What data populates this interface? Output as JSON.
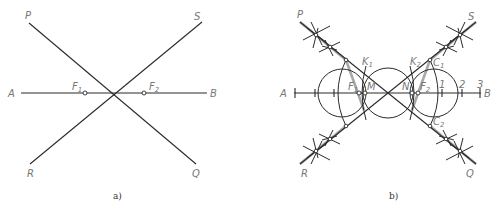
{
  "figure_a": {
    "caption": "a)",
    "labels": {
      "P": "P",
      "S": "S",
      "A": "A",
      "B": "B",
      "R": "R",
      "Q": "Q",
      "F1": "F",
      "F1_sub": "1",
      "F2": "F",
      "F2_sub": "2"
    }
  },
  "figure_b": {
    "caption": "b)",
    "labels": {
      "P": "P",
      "S": "S",
      "A": "A",
      "B": "B",
      "R": "R",
      "Q": "Q",
      "K1": "K",
      "K1_sub": "1",
      "K2": "K",
      "K2_sub": "2",
      "F1": "F",
      "F1_sub": "1",
      "F2": "F",
      "F2_sub": "2",
      "M": "M",
      "N": "N",
      "C1": "C",
      "C1_sub": "1",
      "C2": "C",
      "C2_sub": "2",
      "tick1": "1",
      "tick2": "2",
      "tick3": "3"
    }
  },
  "colors": {
    "line": "#2a2a2a",
    "highlight": "#a8a8a8",
    "label": "#777777"
  }
}
